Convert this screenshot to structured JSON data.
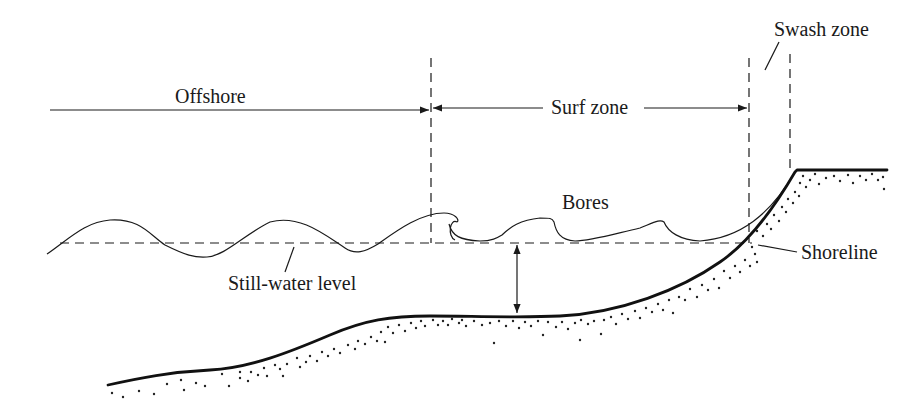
{
  "diagram": {
    "labels": {
      "offshore": "Offshore",
      "surf_zone": "Surf zone",
      "swash_zone": "Swash zone",
      "bores": "Bores",
      "shoreline": "Shoreline",
      "still_water_level": "Still-water level"
    },
    "colors": {
      "line": "#1a1a1a",
      "background": "#ffffff"
    }
  }
}
